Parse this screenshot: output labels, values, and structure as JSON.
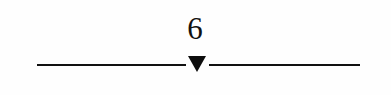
{
  "figure": {
    "kind": "number-line-marker",
    "label": "6",
    "background_color": "#fefefe",
    "ink_color": "#111111"
  },
  "axis": {
    "line_color": "#111111",
    "line_thickness_px": 2,
    "left_segment": {
      "start_x": 37,
      "end_x": 186
    },
    "right_segment": {
      "start_x": 209,
      "end_x": 360
    },
    "baseline_y": 64
  },
  "marker": {
    "icon": "triangle-down-icon",
    "shape": "solid-downward-triangle",
    "color": "#0d0d0d",
    "apex_x": 197,
    "top_y": 56,
    "width_px": 18,
    "height_px": 16,
    "points_to": "6"
  },
  "chart_data": {
    "type": "scatter",
    "title": "",
    "xlabel": "",
    "ylabel": "",
    "categories": [
      "6"
    ],
    "values": [
      6
    ],
    "annotations": [
      "6"
    ],
    "grid": false,
    "legend": "none"
  }
}
